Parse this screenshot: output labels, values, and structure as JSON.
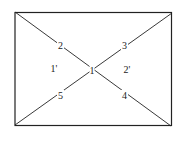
{
  "diagram": {
    "type": "rectangle-with-diagonals",
    "stroke_color": "#222222",
    "background_color": "#ffffff",
    "rectangle": {
      "top_left": [
        15,
        12
      ],
      "top_right": [
        172,
        13
      ],
      "bottom_left": [
        15,
        125
      ],
      "bottom_right": [
        171,
        126
      ]
    },
    "center_label": {
      "text": "1",
      "x": 92,
      "y": 73
    },
    "point_labels": [
      {
        "id": "2",
        "text": "2",
        "x": 60,
        "y": 48
      },
      {
        "id": "3",
        "text": "3",
        "x": 124,
        "y": 48
      },
      {
        "id": "4",
        "text": "4",
        "x": 124,
        "y": 98
      },
      {
        "id": "5",
        "text": "5",
        "x": 60,
        "y": 98
      }
    ],
    "region_labels": [
      {
        "id": "1-prime",
        "text": "1'",
        "x": 53,
        "y": 72
      },
      {
        "id": "2-prime",
        "text": "2'",
        "x": 126,
        "y": 73
      }
    ]
  }
}
